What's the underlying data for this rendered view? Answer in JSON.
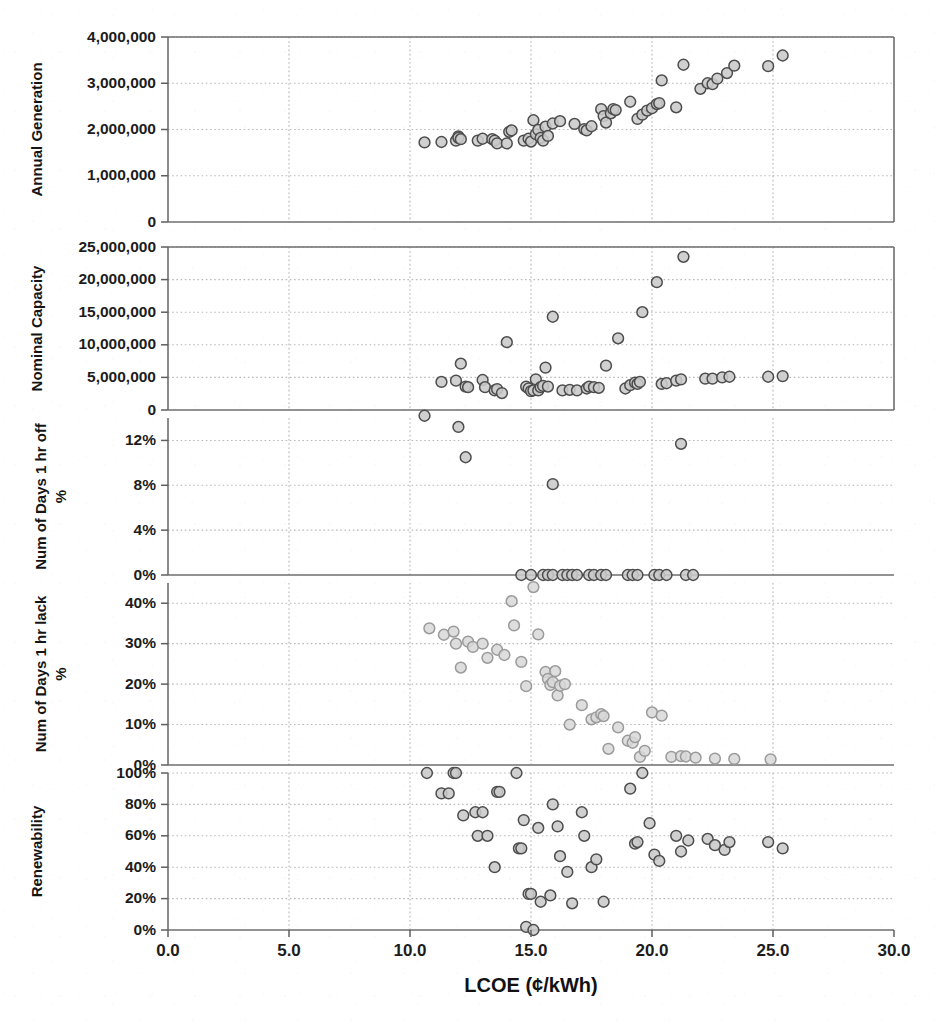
{
  "chart_data": {
    "type": "scatter",
    "title": "",
    "xlabel": "LCOE (¢/kWh)",
    "xlim": [
      0.0,
      30.0
    ],
    "xticks": [
      "0.0",
      "5.0",
      "10.0",
      "15.0",
      "20.0",
      "25.0",
      "30.0"
    ],
    "xtick_values": [
      0,
      5,
      10,
      15,
      20,
      25,
      30
    ],
    "grid": true,
    "legend": null,
    "layout": "5 stacked panels sharing one x-axis",
    "panels": [
      {
        "id": "annual-generation",
        "ylabel": "Annual Generation",
        "ylabel_sub": "",
        "ylim": [
          0,
          4000000
        ],
        "yticks": [
          "0",
          "1,000,000",
          "2,000,000",
          "3,000,000",
          "4,000,000"
        ],
        "ytick_values": [
          0,
          1000000,
          2000000,
          3000000,
          4000000
        ],
        "marker": "open-circle",
        "points": [
          [
            10.6,
            1720000
          ],
          [
            11.3,
            1730000
          ],
          [
            11.9,
            1760000
          ],
          [
            12.0,
            1850000
          ],
          [
            12.0,
            1820000
          ],
          [
            12.1,
            1790000
          ],
          [
            12.8,
            1760000
          ],
          [
            13.0,
            1800000
          ],
          [
            13.4,
            1790000
          ],
          [
            13.5,
            1760000
          ],
          [
            13.6,
            1700000
          ],
          [
            14.0,
            1700000
          ],
          [
            14.1,
            1950000
          ],
          [
            14.2,
            1980000
          ],
          [
            14.7,
            1760000
          ],
          [
            14.9,
            1800000
          ],
          [
            15.0,
            1740000
          ],
          [
            15.1,
            2200000
          ],
          [
            15.2,
            1900000
          ],
          [
            15.3,
            1990000
          ],
          [
            15.4,
            1820000
          ],
          [
            15.5,
            1760000
          ],
          [
            15.6,
            2060000
          ],
          [
            15.7,
            1860000
          ],
          [
            15.9,
            2130000
          ],
          [
            16.2,
            2180000
          ],
          [
            16.8,
            2120000
          ],
          [
            17.2,
            2010000
          ],
          [
            17.3,
            1980000
          ],
          [
            17.5,
            2070000
          ],
          [
            17.9,
            2440000
          ],
          [
            18.0,
            2290000
          ],
          [
            18.1,
            2150000
          ],
          [
            18.3,
            2350000
          ],
          [
            18.4,
            2440000
          ],
          [
            18.5,
            2420000
          ],
          [
            19.1,
            2600000
          ],
          [
            19.4,
            2230000
          ],
          [
            19.6,
            2320000
          ],
          [
            19.8,
            2410000
          ],
          [
            20.0,
            2460000
          ],
          [
            20.2,
            2550000
          ],
          [
            20.3,
            2570000
          ],
          [
            20.4,
            3060000
          ],
          [
            21.0,
            2480000
          ],
          [
            21.3,
            3400000
          ],
          [
            22.0,
            2880000
          ],
          [
            22.3,
            3000000
          ],
          [
            22.5,
            2980000
          ],
          [
            22.7,
            3100000
          ],
          [
            23.1,
            3220000
          ],
          [
            23.4,
            3380000
          ],
          [
            24.8,
            3370000
          ],
          [
            25.4,
            3600000
          ]
        ]
      },
      {
        "id": "nominal-capacity",
        "ylabel": "Nominal Capacity",
        "ylabel_sub": "",
        "ylim": [
          0,
          25000000
        ],
        "yticks": [
          "0",
          "5,000,000",
          "10,000,000",
          "15,000,000",
          "20,000,000",
          "25,000,000"
        ],
        "ytick_values": [
          0,
          5000000,
          10000000,
          15000000,
          20000000,
          25000000
        ],
        "marker": "open-circle",
        "points": [
          [
            11.3,
            4300000
          ],
          [
            11.9,
            4500000
          ],
          [
            12.1,
            7100000
          ],
          [
            12.3,
            3600000
          ],
          [
            12.4,
            3500000
          ],
          [
            13.0,
            4600000
          ],
          [
            13.1,
            3500000
          ],
          [
            13.5,
            3000000
          ],
          [
            13.6,
            3200000
          ],
          [
            13.8,
            2600000
          ],
          [
            14.0,
            10400000
          ],
          [
            14.8,
            3600000
          ],
          [
            14.9,
            3300000
          ],
          [
            15.0,
            2900000
          ],
          [
            15.1,
            3000000
          ],
          [
            15.2,
            4700000
          ],
          [
            15.3,
            3000000
          ],
          [
            15.4,
            3500000
          ],
          [
            15.5,
            3700000
          ],
          [
            15.6,
            6500000
          ],
          [
            15.7,
            3600000
          ],
          [
            15.9,
            14300000
          ],
          [
            16.3,
            3000000
          ],
          [
            16.6,
            3100000
          ],
          [
            16.9,
            3000000
          ],
          [
            17.3,
            3300000
          ],
          [
            17.4,
            3600000
          ],
          [
            17.6,
            3500000
          ],
          [
            17.8,
            3400000
          ],
          [
            18.1,
            6800000
          ],
          [
            18.6,
            11000000
          ],
          [
            18.9,
            3300000
          ],
          [
            19.1,
            3800000
          ],
          [
            19.3,
            4200000
          ],
          [
            19.4,
            4000000
          ],
          [
            19.5,
            4300000
          ],
          [
            19.6,
            15000000
          ],
          [
            20.2,
            19600000
          ],
          [
            20.4,
            4000000
          ],
          [
            20.6,
            4100000
          ],
          [
            21.0,
            4500000
          ],
          [
            21.2,
            4700000
          ],
          [
            21.3,
            23500000
          ],
          [
            22.2,
            4800000
          ],
          [
            22.5,
            4800000
          ],
          [
            22.9,
            5000000
          ],
          [
            23.2,
            5100000
          ],
          [
            24.8,
            5100000
          ],
          [
            25.4,
            5200000
          ]
        ]
      },
      {
        "id": "num-days-1hr-off",
        "ylabel": "Num of Days 1 hr off",
        "ylabel_sub": "%",
        "ylim": [
          0,
          0.14
        ],
        "yticks": [
          "0%",
          "4%",
          "8%",
          "12%"
        ],
        "ytick_values": [
          0,
          0.04,
          0.08,
          0.12
        ],
        "marker": "open-circle",
        "points": [
          [
            10.6,
            0.142
          ],
          [
            12.0,
            0.132
          ],
          [
            12.3,
            0.105
          ],
          [
            15.9,
            0.081
          ],
          [
            21.2,
            0.117
          ],
          [
            14.6,
            0
          ],
          [
            15.0,
            0
          ],
          [
            15.5,
            0
          ],
          [
            15.7,
            0
          ],
          [
            15.9,
            0
          ],
          [
            16.3,
            0
          ],
          [
            16.5,
            0
          ],
          [
            16.7,
            0
          ],
          [
            16.9,
            0
          ],
          [
            17.4,
            0
          ],
          [
            17.6,
            0
          ],
          [
            17.9,
            0
          ],
          [
            18.1,
            0
          ],
          [
            19.0,
            0
          ],
          [
            19.2,
            0
          ],
          [
            19.4,
            0
          ],
          [
            20.1,
            0
          ],
          [
            20.3,
            0
          ],
          [
            20.6,
            0
          ],
          [
            21.4,
            0
          ],
          [
            21.7,
            0
          ]
        ]
      },
      {
        "id": "num-days-1hr-lack",
        "ylabel": "Num of Days 1 hr lack",
        "ylabel_sub": "%",
        "ylim": [
          0,
          0.45
        ],
        "yticks": [
          "0%",
          "10%",
          "20%",
          "30%",
          "40%"
        ],
        "ytick_values": [
          0,
          0.1,
          0.2,
          0.3,
          0.4
        ],
        "marker": "open-circle-light",
        "points": [
          [
            10.8,
            0.338
          ],
          [
            11.4,
            0.322
          ],
          [
            11.8,
            0.33
          ],
          [
            11.9,
            0.3
          ],
          [
            12.1,
            0.241
          ],
          [
            12.4,
            0.305
          ],
          [
            12.6,
            0.292
          ],
          [
            13.0,
            0.3
          ],
          [
            13.2,
            0.265
          ],
          [
            13.6,
            0.285
          ],
          [
            13.9,
            0.272
          ],
          [
            14.2,
            0.405
          ],
          [
            14.3,
            0.345
          ],
          [
            14.6,
            0.255
          ],
          [
            14.8,
            0.195
          ],
          [
            15.1,
            0.44
          ],
          [
            15.3,
            0.323
          ],
          [
            15.6,
            0.23
          ],
          [
            15.7,
            0.213
          ],
          [
            15.8,
            0.198
          ],
          [
            15.9,
            0.205
          ],
          [
            16.0,
            0.232
          ],
          [
            16.1,
            0.172
          ],
          [
            16.2,
            0.196
          ],
          [
            16.4,
            0.2
          ],
          [
            16.6,
            0.1
          ],
          [
            17.1,
            0.148
          ],
          [
            17.5,
            0.113
          ],
          [
            17.7,
            0.118
          ],
          [
            17.9,
            0.126
          ],
          [
            18.0,
            0.121
          ],
          [
            18.2,
            0.04
          ],
          [
            18.6,
            0.093
          ],
          [
            19.0,
            0.06
          ],
          [
            19.2,
            0.055
          ],
          [
            19.3,
            0.069
          ],
          [
            19.5,
            0.02
          ],
          [
            19.7,
            0.035
          ],
          [
            20.0,
            0.13
          ],
          [
            20.4,
            0.122
          ],
          [
            20.8,
            0.02
          ],
          [
            21.2,
            0.022
          ],
          [
            21.4,
            0.021
          ],
          [
            21.8,
            0.018
          ],
          [
            22.6,
            0.016
          ],
          [
            23.4,
            0.015
          ],
          [
            24.9,
            0.014
          ]
        ]
      },
      {
        "id": "renewability",
        "ylabel": "Renewability",
        "ylabel_sub": "",
        "ylim": [
          0,
          1.0
        ],
        "yticks": [
          "0%",
          "20%",
          "40%",
          "60%",
          "80%",
          "100%"
        ],
        "ytick_values": [
          0,
          0.2,
          0.4,
          0.6,
          0.8,
          1.0
        ],
        "marker": "open-circle",
        "points": [
          [
            10.7,
            1.0
          ],
          [
            11.3,
            0.87
          ],
          [
            11.8,
            1.0
          ],
          [
            11.9,
            1.0
          ],
          [
            11.6,
            0.87
          ],
          [
            12.2,
            0.73
          ],
          [
            12.7,
            0.75
          ],
          [
            13.0,
            0.75
          ],
          [
            12.8,
            0.6
          ],
          [
            13.2,
            0.6
          ],
          [
            13.6,
            0.88
          ],
          [
            13.7,
            0.88
          ],
          [
            13.5,
            0.4
          ],
          [
            14.4,
            1.0
          ],
          [
            14.5,
            0.52
          ],
          [
            14.6,
            0.52
          ],
          [
            14.9,
            0.23
          ],
          [
            15.0,
            0.23
          ],
          [
            14.8,
            0.02
          ],
          [
            15.1,
            0.0
          ],
          [
            14.7,
            0.7
          ],
          [
            15.3,
            0.65
          ],
          [
            15.4,
            0.18
          ],
          [
            15.8,
            0.22
          ],
          [
            15.9,
            0.8
          ],
          [
            16.1,
            0.66
          ],
          [
            16.2,
            0.47
          ],
          [
            16.5,
            0.37
          ],
          [
            16.7,
            0.17
          ],
          [
            17.1,
            0.75
          ],
          [
            17.2,
            0.6
          ],
          [
            17.5,
            0.4
          ],
          [
            17.7,
            0.45
          ],
          [
            18.0,
            0.18
          ],
          [
            19.1,
            0.9
          ],
          [
            19.6,
            1.0
          ],
          [
            19.3,
            0.55
          ],
          [
            19.4,
            0.56
          ],
          [
            19.9,
            0.68
          ],
          [
            20.1,
            0.48
          ],
          [
            20.3,
            0.44
          ],
          [
            21.0,
            0.6
          ],
          [
            21.2,
            0.5
          ],
          [
            21.5,
            0.57
          ],
          [
            22.3,
            0.58
          ],
          [
            22.6,
            0.54
          ],
          [
            23.0,
            0.51
          ],
          [
            23.2,
            0.56
          ],
          [
            24.8,
            0.56
          ],
          [
            25.4,
            0.52
          ]
        ]
      }
    ]
  }
}
